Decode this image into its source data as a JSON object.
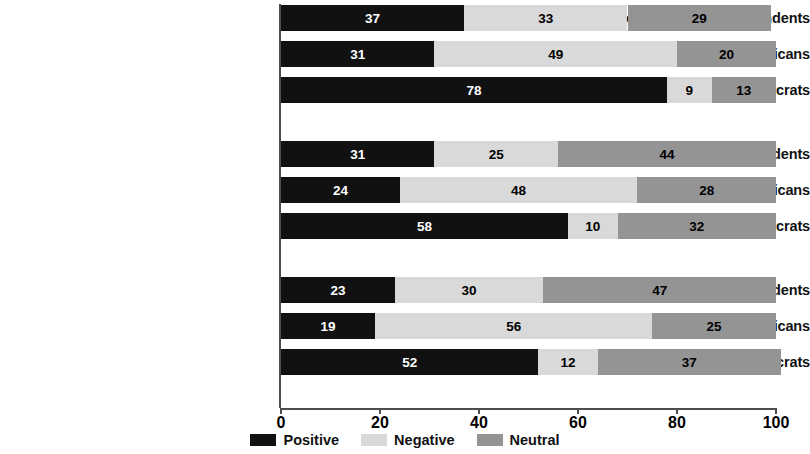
{
  "chart_data": {
    "type": "bar",
    "orientation": "horizontal",
    "stacked": true,
    "title": "",
    "subtitle": "",
    "xlabel": "",
    "ylabel": "",
    "xlim": [
      0,
      100
    ],
    "xticks": [
      "0",
      "20",
      "40",
      "60",
      "80",
      "100"
    ],
    "grid": false,
    "legend_position": "bottom-center",
    "categories": [
      "(School Board) Independents",
      "(School Board) Republicans",
      "(School Board) Democrats",
      "(General Population) Independents",
      "(General Population) Republicans",
      "(General Population) Democrats",
      "(Parents) Independents",
      "(Parents) Republicans",
      "(Parents) Democrats"
    ],
    "series": [
      {
        "name": "Positive",
        "color": "#111111",
        "values": [
          37,
          31,
          78,
          31,
          24,
          58,
          23,
          19,
          52
        ]
      },
      {
        "name": "Negative",
        "color": "#d9d9d9",
        "values": [
          33,
          49,
          9,
          25,
          48,
          10,
          30,
          56,
          12
        ]
      },
      {
        "name": "Neutral",
        "color": "#949494",
        "values": [
          29,
          20,
          13,
          44,
          28,
          32,
          47,
          25,
          37
        ]
      }
    ],
    "groups": [
      {
        "name": "School Board",
        "rows": [
          {
            "label": "(School Board) Independents",
            "positive": 37,
            "negative": 33,
            "neutral": 29
          },
          {
            "label": "(School Board) Republicans",
            "positive": 31,
            "negative": 49,
            "neutral": 20
          },
          {
            "label": "(School Board) Democrats",
            "positive": 78,
            "negative": 9,
            "neutral": 13
          }
        ]
      },
      {
        "name": "General Population",
        "rows": [
          {
            "label": "(General Population) Independents",
            "positive": 31,
            "negative": 25,
            "neutral": 44
          },
          {
            "label": "(General Population) Republicans",
            "positive": 24,
            "negative": 48,
            "neutral": 28
          },
          {
            "label": "(General Population) Democrats",
            "positive": 58,
            "negative": 10,
            "neutral": 32
          }
        ]
      },
      {
        "name": "Parents",
        "rows": [
          {
            "label": "(Parents) Independents",
            "positive": 23,
            "negative": 30,
            "neutral": 47
          },
          {
            "label": "(Parents) Republicans",
            "positive": 19,
            "negative": 56,
            "neutral": 25
          },
          {
            "label": "(Parents) Democrats",
            "positive": 52,
            "negative": 12,
            "neutral": 37
          }
        ]
      }
    ]
  },
  "legend": {
    "items": [
      {
        "label": "Positive",
        "color": "#111111"
      },
      {
        "label": "Negative",
        "color": "#d9d9d9"
      },
      {
        "label": "Neutral",
        "color": "#949494"
      }
    ]
  },
  "axis": {
    "ticks": [
      {
        "label": "0",
        "value": 0
      },
      {
        "label": "20",
        "value": 20
      },
      {
        "label": "40",
        "value": 40
      },
      {
        "label": "60",
        "value": 60
      },
      {
        "label": "80",
        "value": 80
      },
      {
        "label": "100",
        "value": 100
      }
    ]
  }
}
